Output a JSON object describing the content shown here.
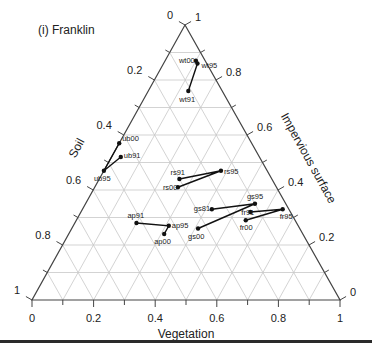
{
  "chart_data": {
    "type": "ternary",
    "title": "(i) Franklin",
    "axes": {
      "bottom": {
        "label": "Vegetation",
        "ticks": [
          "0",
          "0.2",
          "0.4",
          "0.6",
          "0.8",
          "1"
        ],
        "range": [
          0,
          1
        ]
      },
      "left": {
        "label": "Soil",
        "ticks": [
          "0",
          "0.2",
          "0.4",
          "0.6",
          "0.8",
          "1"
        ],
        "range": [
          0,
          1
        ]
      },
      "right": {
        "label": "Impervious surface",
        "ticks": [
          "0",
          "0.2",
          "0.4",
          "0.6",
          "0.8",
          "1"
        ],
        "range": [
          0,
          1
        ]
      }
    },
    "grid": true,
    "grid_step": 0.1,
    "series": [
      {
        "name": "wt",
        "path": [
          "wt00",
          "wt95",
          "wt91"
        ],
        "points": [
          {
            "label": "wt00",
            "vegetation": 0.1,
            "impervious": 0.87,
            "soil": 0.03
          },
          {
            "label": "wt95",
            "vegetation": 0.11,
            "impervious": 0.86,
            "soil": 0.03
          },
          {
            "label": "wt91",
            "vegetation": 0.13,
            "impervious": 0.76,
            "soil": 0.11
          }
        ]
      },
      {
        "name": "ub",
        "path": [
          "ub00",
          "ub95",
          "ub91"
        ],
        "points": [
          {
            "label": "ub00",
            "vegetation": 0.0,
            "impervious": 0.57,
            "soil": 0.43
          },
          {
            "label": "ub91",
            "vegetation": 0.03,
            "impervious": 0.52,
            "soil": 0.45
          },
          {
            "label": "ub95",
            "vegetation": 0.0,
            "impervious": 0.47,
            "soil": 0.53
          }
        ]
      },
      {
        "name": "rs",
        "path": [
          "rs91",
          "rs95",
          "rs00"
        ],
        "points": [
          {
            "label": "rs91",
            "vegetation": 0.26,
            "impervious": 0.44,
            "soil": 0.3
          },
          {
            "label": "rs95",
            "vegetation": 0.38,
            "impervious": 0.47,
            "soil": 0.15
          },
          {
            "label": "rs00",
            "vegetation": 0.27,
            "impervious": 0.41,
            "soil": 0.32
          }
        ]
      },
      {
        "name": "gs",
        "path": [
          "gs81",
          "gs95",
          "gs00"
        ],
        "points": [
          {
            "label": "gs81",
            "vegetation": 0.42,
            "impervious": 0.33,
            "soil": 0.25
          },
          {
            "label": "gs95",
            "vegetation": 0.55,
            "impervious": 0.35,
            "soil": 0.1
          },
          {
            "label": "gs00",
            "vegetation": 0.41,
            "impervious": 0.26,
            "soil": 0.33
          }
        ]
      },
      {
        "name": "fr",
        "path": [
          "fr91",
          "fr95",
          "fr00"
        ],
        "points": [
          {
            "label": "fr91",
            "vegetation": 0.55,
            "impervious": 0.32,
            "soil": 0.13
          },
          {
            "label": "fr95",
            "vegetation": 0.65,
            "impervious": 0.33,
            "soil": 0.02
          },
          {
            "label": "fr00",
            "vegetation": 0.55,
            "impervious": 0.29,
            "soil": 0.16
          }
        ]
      },
      {
        "name": "ap",
        "path": [
          "ap91",
          "ap95",
          "ap00"
        ],
        "points": [
          {
            "label": "ap91",
            "vegetation": 0.2,
            "impervious": 0.28,
            "soil": 0.52
          },
          {
            "label": "ap95",
            "vegetation": 0.31,
            "impervious": 0.27,
            "soil": 0.42
          },
          {
            "label": "ap00",
            "vegetation": 0.31,
            "impervious": 0.24,
            "soil": 0.45
          }
        ]
      }
    ]
  },
  "labels": {
    "title": "(i) Franklin",
    "vegetation": "Vegetation",
    "soil": "Soil",
    "impervious": "Impervious surface"
  },
  "colors": {
    "axis": "#444444",
    "grid": "#c8c8c8",
    "data": "#111111"
  }
}
